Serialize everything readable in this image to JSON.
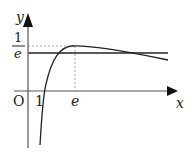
{
  "diagram": {
    "axis_labels": {
      "x": "x",
      "y": "y",
      "origin": "O"
    },
    "tick_labels": {
      "x_one": "1",
      "x_e": "e"
    },
    "y_fraction": {
      "numerator": "1",
      "denominator": "e"
    },
    "colors": {
      "stroke": "#222222",
      "dotted": "#aaaaaa",
      "background": "#ffffff"
    }
  }
}
